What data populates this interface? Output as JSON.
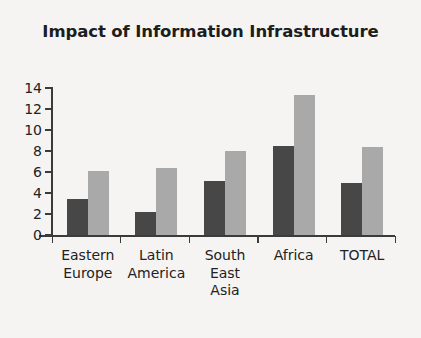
{
  "chart_data": {
    "type": "bar",
    "title": "Impact of Information Infrastructure",
    "xlabel": "",
    "ylabel": "",
    "ylim": [
      0,
      14
    ],
    "yticks": [
      0,
      2,
      4,
      6,
      8,
      10,
      12,
      14
    ],
    "ytick_labels": [
      "0",
      "2",
      "4",
      "6",
      "8",
      "10",
      "12",
      "14"
    ],
    "grid": false,
    "legend": "none",
    "categories": [
      "Eastern Europe",
      "Latin America",
      "South East Asia",
      "Africa",
      "TOTAL"
    ],
    "category_lines": [
      [
        "Eastern",
        "Europe"
      ],
      [
        "Latin",
        "America"
      ],
      [
        "South",
        "East",
        "Asia"
      ],
      [
        "Africa"
      ],
      [
        "TOTAL"
      ]
    ],
    "series": [
      {
        "name": "Series 1",
        "color": "#474747",
        "values": [
          3.4,
          2.2,
          5.1,
          8.5,
          5.0
        ]
      },
      {
        "name": "Series 2",
        "color": "#a9a9a9",
        "values": [
          6.1,
          6.4,
          8.0,
          13.3,
          8.4
        ]
      }
    ]
  },
  "colors": {
    "background": "#f5f4f2",
    "axis": "#3b3b3b",
    "text": "#222222",
    "series_dark": "#474747",
    "series_light": "#a9a9a9"
  }
}
